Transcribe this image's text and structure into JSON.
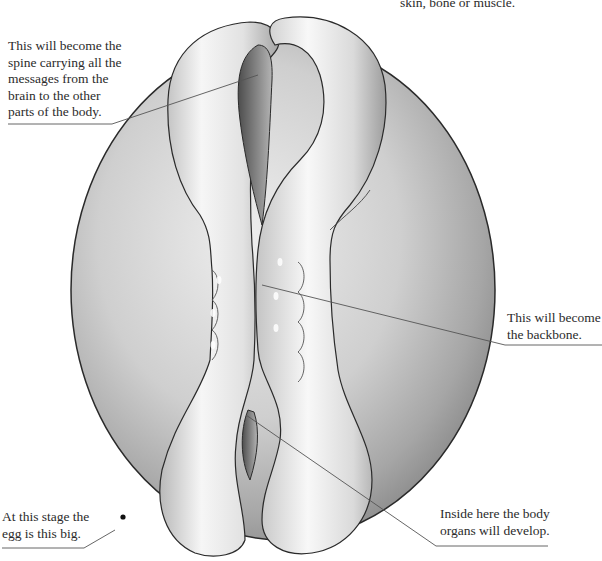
{
  "figure": {
    "callouts": [
      {
        "id": "top",
        "text": "skin, bone or muscle.",
        "partial_line_above": "…"
      },
      {
        "id": "spine",
        "text": "This will become the\nspine carrying all the\nmessages from the\nbrain to the other\nparts of the body."
      },
      {
        "id": "backbone",
        "text": "This will become\nthe backbone."
      },
      {
        "id": "egg",
        "text": "At this stage the\negg is this big."
      },
      {
        "id": "organs",
        "text": "Inside here the body\norgans will develop."
      }
    ]
  },
  "colors": {
    "background": "#ffffff",
    "outline": "#2a2a2a",
    "leader_line": "#555555",
    "egg_light": "#e6e6e6",
    "egg_dark": "#8e8e8e",
    "tube_light": "#f4f4f4",
    "tube_shade": "#a9a9a9"
  }
}
